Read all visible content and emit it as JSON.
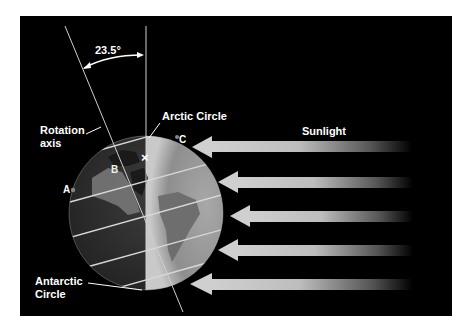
{
  "diagram": {
    "angle_label": "23.5°",
    "labels": {
      "rotation_axis_line1": "Rotation",
      "rotation_axis_line2": "axis",
      "arctic_circle": "Arctic Circle",
      "antarctic_line1": "Antarctic",
      "antarctic_line2": "Circle",
      "sunlight": "Sunlight"
    },
    "points": {
      "a": "A",
      "b": "B",
      "c": "C",
      "x": "×"
    },
    "arrows_count": 5,
    "colors": {
      "background": "#000000",
      "frame_border": "#ffffff",
      "globe_day": "#9a9a9a",
      "globe_night": "#3a3a3a",
      "arrow": "#c8c8c8",
      "text": "#ffffff"
    }
  }
}
